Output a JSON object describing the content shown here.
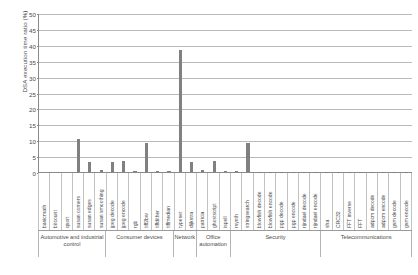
{
  "chart_data": {
    "type": "bar",
    "title": "",
    "xlabel": "",
    "ylabel": "DSA execution time ratio (%)",
    "ylim": [
      0,
      50
    ],
    "ystep": 5,
    "yticks": [
      "0",
      "5",
      "10",
      "15",
      "20",
      "25",
      "30",
      "35",
      "40",
      "45",
      "50"
    ],
    "grid": true,
    "legend": false,
    "bar_color": "#808080",
    "categories": [
      "basicmath",
      "bitcount",
      "qsort",
      "susan corners",
      "susan edges",
      "susan smoothing",
      "jpeg decode",
      "jpeg encode",
      "rgb",
      "tiff2bw",
      "tiffdither",
      "tiffmedian",
      "typeset",
      "dijkstra",
      "patricia",
      "ghostscript",
      "ispell",
      "rsynth",
      "stringsearch",
      "blowfish decode",
      "blowfish encode",
      "pgp decode",
      "pgp encode",
      "rijndael decode",
      "rijndael encode",
      "sha",
      "CRC32",
      "FFT inverse",
      "FFT",
      "adpcm decode",
      "adpcm encode",
      "gsm decode",
      "gsm encode"
    ],
    "values": [
      0,
      0,
      0,
      10.5,
      3.0,
      0.6,
      3.0,
      3.4,
      0.3,
      9.0,
      0.3,
      0.4,
      38.5,
      3.2,
      0.5,
      3.4,
      0.4,
      0.3,
      9.2,
      0.1,
      0.1,
      0.1,
      0.1,
      0.1,
      0.1,
      0.1,
      0.1,
      0.1,
      0.1,
      0.1,
      0.1,
      0.1,
      0.1
    ],
    "groups": [
      {
        "label": "Automotive and industrial control",
        "span": 6
      },
      {
        "label": "Consumer devices",
        "span": 6
      },
      {
        "label": "Network",
        "span": 2
      },
      {
        "label": "Office automation",
        "span": 3
      },
      {
        "label": "Security",
        "span": 8
      },
      {
        "label": "Telecommunications",
        "span": 8
      }
    ]
  }
}
